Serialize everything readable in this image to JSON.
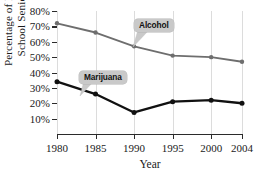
{
  "chart_data": {
    "type": "line",
    "title": "",
    "xlabel": "Year",
    "ylabel": "Percentage of High School Seniors",
    "ylabel_lines": [
      "Percentage of High",
      "School Seniors"
    ],
    "x": [
      1980,
      1985,
      1990,
      1995,
      2000,
      2004
    ],
    "categories": [
      "1980",
      "1985",
      "1990",
      "1995",
      "2000",
      "2004"
    ],
    "xlim": [
      1980,
      2004
    ],
    "ylim": [
      0,
      80
    ],
    "yticks": [
      10,
      20,
      30,
      40,
      50,
      60,
      70,
      80
    ],
    "ytick_labels": [
      "10%",
      "20%",
      "30%",
      "40%",
      "50%",
      "60%",
      "70%",
      "80%"
    ],
    "grid": "vertical",
    "legend": "inline-callouts",
    "series": [
      {
        "name": "Alcohol",
        "color": "#6e6e6e",
        "values": [
          72,
          66,
          57,
          51,
          50,
          47
        ]
      },
      {
        "name": "Marijuana",
        "color": "#111111",
        "values": [
          34,
          26,
          14,
          21,
          22,
          20
        ]
      }
    ],
    "annotations": [
      {
        "label": "Alcohol",
        "attached_to": "Alcohol"
      },
      {
        "label": "Marijuana",
        "attached_to": "Marijuana"
      }
    ]
  },
  "axes": {
    "x_title": "Year",
    "y_title_line1": "Percentage of High",
    "y_title_line2": "School Seniors"
  }
}
